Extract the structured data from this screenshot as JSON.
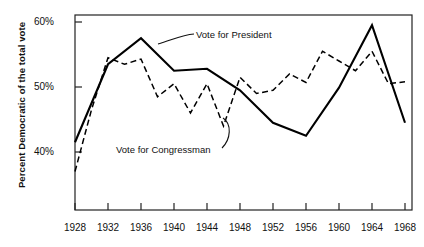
{
  "figure": {
    "name": "democratic-vote-share-line-chart"
  },
  "axes": {
    "ylabel": "Percent Democratic of the total vote",
    "yticks": [
      "60%",
      "50%",
      "40%"
    ],
    "ytick_values": [
      60,
      50,
      40
    ],
    "xticks": [
      "1928",
      "1932",
      "1936",
      "1940",
      "1944",
      "1948",
      "1952",
      "1956",
      "1960",
      "1964",
      "1968"
    ],
    "xtick_values": [
      1928,
      1932,
      1936,
      1940,
      1944,
      1948,
      1952,
      1956,
      1960,
      1964,
      1968
    ]
  },
  "annotations": [
    {
      "id": "president",
      "text": "Vote for  President"
    },
    {
      "id": "congressman",
      "text": "Vote for Congressman"
    }
  ],
  "colors": {
    "line": "#000000",
    "frame": "#222222",
    "background": "#ffffff",
    "text": "#111111"
  },
  "chart_data": {
    "type": "line",
    "title": "",
    "xlabel": "",
    "ylabel": "Percent Democratic of the total vote",
    "xlim": [
      1927,
      1969
    ],
    "ylim": [
      33,
      62
    ],
    "grid": false,
    "legend": "annotated-inline",
    "series": [
      {
        "name": "Vote for  President",
        "style": "solid",
        "x": [
          1928,
          1932,
          1936,
          1940,
          1944,
          1948,
          1952,
          1956,
          1960,
          1964,
          1968
        ],
        "values": [
          41.5,
          53.5,
          57.5,
          52.5,
          52.8,
          49.5,
          44.5,
          42.5,
          49.9,
          59.5,
          44.5
        ]
      },
      {
        "name": "Vote for Congressman",
        "style": "dashed",
        "x": [
          1928,
          1930,
          1932,
          1934,
          1936,
          1938,
          1940,
          1942,
          1944,
          1946,
          1948,
          1950,
          1952,
          1954,
          1956,
          1958,
          1960,
          1962,
          1964,
          1966,
          1968
        ],
        "values": [
          37.0,
          46.5,
          54.5,
          53.5,
          54.3,
          48.5,
          50.5,
          46.0,
          50.5,
          44.0,
          51.5,
          49.0,
          49.5,
          52.0,
          50.7,
          55.5,
          54.0,
          52.5,
          55.5,
          50.5,
          50.8
        ]
      }
    ]
  }
}
